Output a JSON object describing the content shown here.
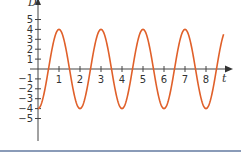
{
  "chart_data": {
    "type": "line",
    "title": "",
    "xlabel": "t",
    "ylabel": "D",
    "function": "D = -4cos(πt)",
    "x_ticks": [
      1,
      2,
      3,
      4,
      5,
      6,
      7,
      8
    ],
    "y_ticks": [
      5,
      4,
      3,
      2,
      1,
      -1,
      -2,
      -3,
      -4,
      -5
    ],
    "xlim": [
      0,
      9
    ],
    "ylim": [
      -7,
      6.5
    ],
    "grid": false,
    "legend": null,
    "series": [
      {
        "name": "D(t)",
        "color": "#e0602a",
        "x": [
          0,
          0.5,
          1,
          1.5,
          2,
          2.5,
          3,
          3.5,
          4,
          4.5,
          5,
          5.5,
          6,
          6.5,
          7,
          7.5,
          8,
          8.5,
          8.85
        ],
        "values": [
          -4,
          0,
          4,
          0,
          -4,
          0,
          4,
          0,
          -4,
          0,
          4,
          0,
          -4,
          0,
          4,
          0,
          -4,
          0,
          3.1
        ]
      }
    ]
  },
  "colors": {
    "axis": "#444444",
    "curve": "#e0602a",
    "bottom_rule": "#8a9bb8"
  }
}
